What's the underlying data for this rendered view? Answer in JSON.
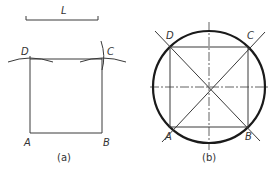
{
  "figure_a": {
    "length_label": "L",
    "vertices": {
      "A": "A",
      "B": "B",
      "C": "C",
      "D": "D"
    },
    "caption": "(a)"
  },
  "figure_b": {
    "vertices": {
      "A": "A",
      "B": "B",
      "C": "C",
      "D": "D"
    },
    "caption": "(b)"
  },
  "colors": {
    "line": "#3a3a3a",
    "outline": "#1a1a1a",
    "background": "#ffffff"
  }
}
